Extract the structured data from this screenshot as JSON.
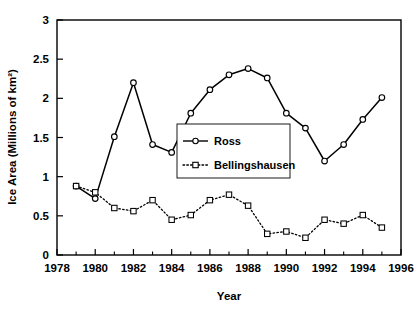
{
  "chart_data": {
    "type": "line",
    "title": "",
    "xlabel": "Year",
    "ylabel": "Ice Area (Millions of km²)",
    "xlim": [
      1978,
      1996
    ],
    "ylim": [
      0,
      3
    ],
    "xticks": [
      1978,
      1980,
      1982,
      1984,
      1986,
      1988,
      1990,
      1992,
      1994,
      1996
    ],
    "xtick_labels": [
      "1978",
      "1980",
      "1982",
      "1984",
      "1986",
      "1988",
      "1990",
      "1992",
      "1994",
      "1996"
    ],
    "xminor_ticks": [
      1979,
      1981,
      1983,
      1985,
      1987,
      1989,
      1991,
      1993,
      1995
    ],
    "yticks": [
      0,
      0.5,
      1,
      1.5,
      2,
      2.5,
      3
    ],
    "ytick_labels": [
      "0",
      "0.5",
      "1",
      "1.5",
      "2",
      "2.5",
      "3"
    ],
    "grid": false,
    "legend_position": "center",
    "series": [
      {
        "name": "Ross",
        "marker": "circle",
        "line_style": "solid",
        "color": "#000000",
        "x": [
          1979,
          1980,
          1981,
          1982,
          1983,
          1984,
          1985,
          1986,
          1987,
          1988,
          1989,
          1990,
          1991,
          1992,
          1993,
          1994,
          1995
        ],
        "values": [
          0.88,
          0.72,
          1.51,
          2.2,
          1.41,
          1.31,
          1.81,
          2.11,
          2.3,
          2.38,
          2.26,
          1.81,
          1.62,
          1.2,
          1.41,
          1.73,
          2.01
        ]
      },
      {
        "name": "Bellingshausen",
        "marker": "square",
        "line_style": "dotted",
        "color": "#000000",
        "x": [
          1979,
          1980,
          1981,
          1982,
          1983,
          1984,
          1985,
          1986,
          1987,
          1988,
          1989,
          1990,
          1991,
          1992,
          1993,
          1994,
          1995
        ],
        "values": [
          0.88,
          0.8,
          0.6,
          0.56,
          0.7,
          0.45,
          0.51,
          0.7,
          0.77,
          0.63,
          0.27,
          0.3,
          0.22,
          0.45,
          0.4,
          0.51,
          0.35
        ]
      }
    ]
  },
  "legend": {
    "entries": [
      {
        "label": "Ross"
      },
      {
        "label": "Bellingshausen"
      }
    ]
  }
}
